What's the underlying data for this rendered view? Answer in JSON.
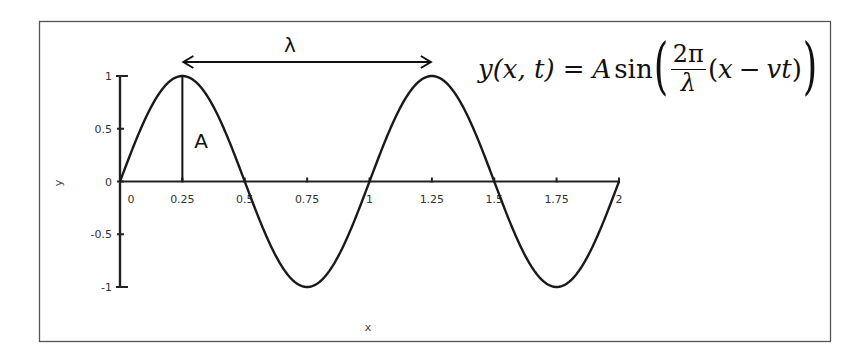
{
  "chart_data": {
    "type": "line",
    "title": "",
    "xlabel": "x",
    "ylabel": "y",
    "xlim": [
      0,
      2
    ],
    "ylim": [
      -1,
      1
    ],
    "grid": false,
    "legend": null,
    "x_ticks": [
      "0",
      "0.25",
      "0.5",
      "0.75",
      "1",
      "1.25",
      "1.5",
      "1.75",
      "2"
    ],
    "x_tick_values": [
      0,
      0.25,
      0.5,
      0.75,
      1,
      1.25,
      1.5,
      1.75,
      2
    ],
    "y_ticks": [
      "1",
      "0.5",
      "0",
      "-0.5",
      "-1"
    ],
    "y_tick_values": [
      1,
      0.5,
      0,
      -0.5,
      -1
    ],
    "series": [
      {
        "name": "y = sin(2πx)",
        "function": "A*sin(2*pi*x/lambda)",
        "amplitude": 1,
        "wavelength": 1,
        "x": [
          0,
          0.125,
          0.25,
          0.375,
          0.5,
          0.625,
          0.75,
          0.875,
          1,
          1.125,
          1.25,
          1.375,
          1.5,
          1.625,
          1.75,
          1.875,
          2
        ],
        "values": [
          0,
          0.707,
          1,
          0.707,
          0,
          -0.707,
          -1,
          -0.707,
          0,
          0.707,
          1,
          0.707,
          0,
          -0.707,
          -1,
          -0.707,
          0
        ]
      }
    ],
    "annotations": [
      {
        "text": "λ",
        "type": "double-arrow",
        "from_x": 0.25,
        "to_x": 1.25,
        "meaning": "wavelength"
      },
      {
        "text": "A",
        "type": "vertical-line",
        "x": 0.25,
        "from_y": 0,
        "to_y": 1,
        "meaning": "amplitude"
      }
    ]
  },
  "annotations": {
    "wavelength_label": "λ",
    "amplitude_label": "A"
  },
  "formula": {
    "lhs_y": "y",
    "lhs_args": "(x, t)",
    "equals": "=",
    "amp": "A",
    "func": "sin",
    "frac_num": "2π",
    "frac_den": "λ",
    "arg_open": "(",
    "arg_x": "x",
    "minus": "−",
    "arg_vt": "vt",
    "arg_close": ")"
  },
  "colors": {
    "curve": "#1a1a1a",
    "axis": "#222222",
    "frame": "#555555",
    "text": "#333333"
  }
}
